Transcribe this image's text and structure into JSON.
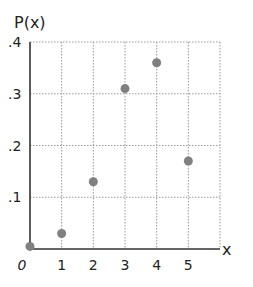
{
  "chart_data": {
    "type": "scatter",
    "title": "",
    "ylabel": "P(x)",
    "xlabel": "x",
    "x": [
      0,
      1,
      2,
      3,
      4,
      5
    ],
    "values": [
      0.005,
      0.03,
      0.13,
      0.31,
      0.36,
      0.17
    ],
    "xticks": [
      "0",
      "1",
      "2",
      "3",
      "4",
      "5"
    ],
    "yticks": [
      ".1",
      ".2",
      ".3",
      ".4"
    ],
    "xlim": [
      0,
      6
    ],
    "ylim": [
      0,
      0.4
    ],
    "grid": true,
    "legend": null,
    "colors": {
      "point": "#808080",
      "axis": "#333333",
      "grid": "#9a9a9a"
    }
  }
}
